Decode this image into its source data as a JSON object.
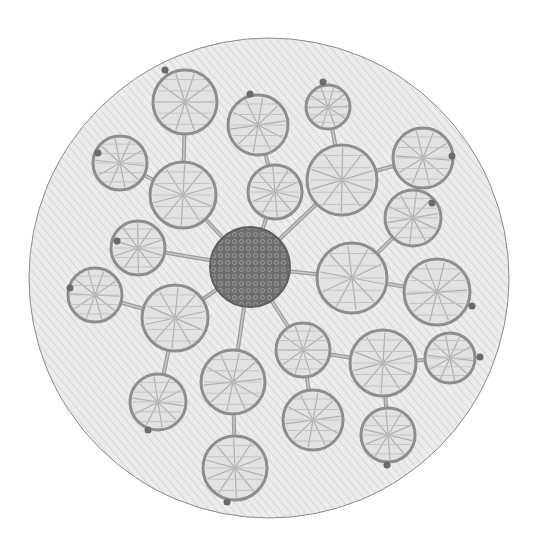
{
  "image": {
    "description": "Grayscale photograph of a circular embroidery on diagonally woven fabric: a dense beaded/French-knot center disc with radiating straight stitches connecting to open woven circular and leaf-shaped motifs.",
    "palette": {
      "background": "#ffffff",
      "fabric": "#ececec",
      "fabric_weave": "#d4d4d4",
      "hoop_edge": "#8a8a8a",
      "motif_outline": "#8e8e8e",
      "motif_fill": "#e2e2e2",
      "motif_thread": "#b0b0b0",
      "center_disc": "#6e6e6e",
      "center_texture": "#9a9a9a",
      "stem": "#9c9c9c",
      "tip_knot": "#6a6a6a"
    },
    "hoop": {
      "cx": 269,
      "cy": 278,
      "r": 240
    },
    "center": {
      "cx": 250,
      "cy": 267,
      "r": 40
    },
    "motifs": [
      {
        "id": "tl-top",
        "cx": 185,
        "cy": 102,
        "r": 32,
        "tip": [
          165,
          70
        ]
      },
      {
        "id": "tl-mid",
        "cx": 183,
        "cy": 195,
        "r": 33
      },
      {
        "id": "tl-leaf",
        "cx": 120,
        "cy": 163,
        "r": 27,
        "tip": [
          98,
          153
        ]
      },
      {
        "id": "tm-top",
        "cx": 258,
        "cy": 125,
        "r": 30,
        "tip": [
          250,
          94
        ]
      },
      {
        "id": "tm-low",
        "cx": 275,
        "cy": 192,
        "r": 27
      },
      {
        "id": "tr-top",
        "cx": 328,
        "cy": 107,
        "r": 22,
        "tip": [
          323,
          82
        ]
      },
      {
        "id": "tr-mid",
        "cx": 342,
        "cy": 180,
        "r": 35
      },
      {
        "id": "tr-leaf",
        "cx": 423,
        "cy": 158,
        "r": 30,
        "tip": [
          452,
          156
        ]
      },
      {
        "id": "r-leaf-top",
        "cx": 413,
        "cy": 218,
        "r": 28,
        "tip": [
          432,
          203
        ]
      },
      {
        "id": "r-mid",
        "cx": 352,
        "cy": 278,
        "r": 35
      },
      {
        "id": "r-leaf-low",
        "cx": 437,
        "cy": 292,
        "r": 33,
        "tip": [
          472,
          306
        ]
      },
      {
        "id": "l-leaf-top",
        "cx": 138,
        "cy": 248,
        "r": 27,
        "tip": [
          117,
          241
        ]
      },
      {
        "id": "l-leaf-far",
        "cx": 95,
        "cy": 295,
        "r": 27,
        "tip": [
          70,
          288
        ]
      },
      {
        "id": "l-big",
        "cx": 175,
        "cy": 318,
        "r": 33
      },
      {
        "id": "l-low",
        "cx": 158,
        "cy": 402,
        "r": 28,
        "tip": [
          148,
          430
        ]
      },
      {
        "id": "b-mid",
        "cx": 233,
        "cy": 382,
        "r": 32
      },
      {
        "id": "b-low",
        "cx": 235,
        "cy": 468,
        "r": 32,
        "tip": [
          227,
          502
        ]
      },
      {
        "id": "br-1",
        "cx": 303,
        "cy": 350,
        "r": 27
      },
      {
        "id": "br-2",
        "cx": 383,
        "cy": 363,
        "r": 33
      },
      {
        "id": "br-3",
        "cx": 450,
        "cy": 358,
        "r": 25,
        "tip": [
          480,
          357
        ]
      },
      {
        "id": "br-low1",
        "cx": 313,
        "cy": 420,
        "r": 30
      },
      {
        "id": "br-low2",
        "cx": 388,
        "cy": 435,
        "r": 27,
        "tip": [
          387,
          465
        ]
      }
    ],
    "stems": [
      [
        "center",
        "tl-mid"
      ],
      [
        "tl-mid",
        "tl-top"
      ],
      [
        "tl-mid",
        "tl-leaf"
      ],
      [
        "center",
        "tm-low"
      ],
      [
        "tm-low",
        "tm-top"
      ],
      [
        "center",
        "tr-mid"
      ],
      [
        "tr-mid",
        "tr-top"
      ],
      [
        "tr-mid",
        "tr-leaf"
      ],
      [
        "center",
        "r-mid"
      ],
      [
        "r-mid",
        "r-leaf-top"
      ],
      [
        "r-mid",
        "r-leaf-low"
      ],
      [
        "center",
        "l-leaf-top"
      ],
      [
        "center",
        "l-big"
      ],
      [
        "l-big",
        "l-leaf-far"
      ],
      [
        "l-big",
        "l-low"
      ],
      [
        "center",
        "b-mid"
      ],
      [
        "b-mid",
        "b-low"
      ],
      [
        "center",
        "br-1"
      ],
      [
        "br-1",
        "br-2"
      ],
      [
        "br-2",
        "br-3"
      ],
      [
        "br-1",
        "br-low1"
      ],
      [
        "br-2",
        "br-low2"
      ]
    ]
  }
}
